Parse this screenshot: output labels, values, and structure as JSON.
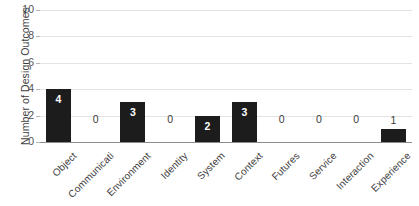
{
  "chart_data": {
    "type": "bar",
    "title": "",
    "xlabel": "",
    "ylabel": "Number of Design Outcomes",
    "ylim": [
      0,
      10
    ],
    "ytick_labels": [
      "0",
      "2",
      "4",
      "6",
      "8",
      "10"
    ],
    "yticks": [
      0,
      2,
      4,
      6,
      8,
      10
    ],
    "grid": true,
    "legend": "none",
    "bar_color": "#1c1c1c",
    "gridline_color": "#e3e3e3",
    "axis_color": "#8c8c8c",
    "background_color": "#ffffff",
    "categories": [
      "Object",
      "Communicati",
      "Environment",
      "Identity",
      "System",
      "Context",
      "Futures",
      "Service",
      "Interaction",
      "Experience"
    ],
    "values": [
      4,
      0,
      3,
      0,
      2,
      3,
      0,
      0,
      0,
      1
    ],
    "data_labels": [
      "4",
      "0",
      "3",
      "0",
      "2",
      "3",
      "0",
      "0",
      "0",
      "1"
    ]
  }
}
